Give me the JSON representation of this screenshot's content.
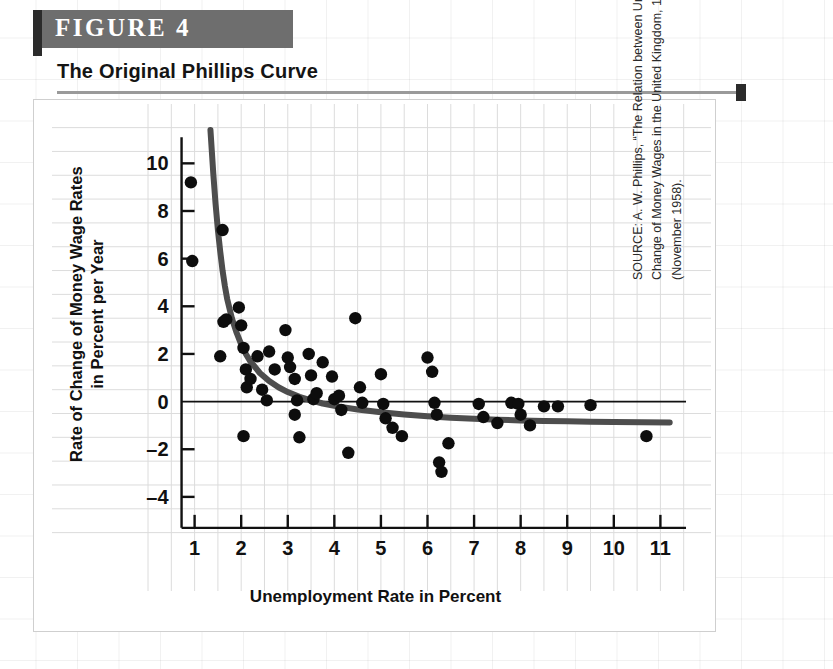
{
  "figure": {
    "banner_label": "FIGURE  4",
    "title": "The Original Phillips Curve",
    "banner_color": "#6e6e6e",
    "accent_color": "#2b2b2b"
  },
  "source": {
    "prefix": "SOURCE: A. W. Phillips, “The Relation between Unemployment and the Rate of Change of Money Wages in the United Kingdom, 1861–1957,” ",
    "journal": "Economica",
    "suffix": ", 25 (November 1958)."
  },
  "chart_data": {
    "type": "scatter",
    "title": "The Original Phillips Curve",
    "xlabel": "Unemployment Rate in Percent",
    "ylabel": "Rate of Change of Money Wage Rates\nin Percent per Year",
    "ylabel_line1": "Rate of Change of Money Wage Rates",
    "ylabel_line2": "in Percent per Year",
    "xlim": [
      0.3,
      11.7
    ],
    "ylim": [
      -5.6,
      11.4
    ],
    "xticks": [
      1,
      2,
      3,
      4,
      5,
      6,
      7,
      8,
      9,
      10,
      11
    ],
    "yticks": [
      10,
      8,
      6,
      4,
      2,
      0,
      -2,
      -4
    ],
    "grid": true,
    "grid_color": "#dcdcdc",
    "zero_line": 0,
    "point_color": "#0d0d0d",
    "point_radius": 6.2,
    "curve_color": "#4d4d4d",
    "curve_width": 6,
    "legend": "none",
    "series": [
      {
        "name": "Phillips scatter (UK 1861-1957)",
        "points": [
          [
            0.92,
            9.2
          ],
          [
            0.95,
            5.9
          ],
          [
            1.6,
            7.2
          ],
          [
            1.62,
            3.35
          ],
          [
            1.68,
            3.45
          ],
          [
            1.55,
            1.9
          ],
          [
            1.95,
            3.95
          ],
          [
            2.0,
            3.2
          ],
          [
            2.05,
            2.25
          ],
          [
            2.1,
            1.35
          ],
          [
            2.12,
            0.6
          ],
          [
            2.2,
            0.95
          ],
          [
            2.05,
            -1.45
          ],
          [
            2.35,
            1.9
          ],
          [
            2.45,
            0.5
          ],
          [
            2.6,
            2.1
          ],
          [
            2.72,
            1.35
          ],
          [
            2.55,
            0.05
          ],
          [
            2.95,
            3.0
          ],
          [
            3.0,
            1.85
          ],
          [
            3.05,
            1.45
          ],
          [
            3.15,
            0.95
          ],
          [
            3.2,
            0.05
          ],
          [
            3.15,
            -0.55
          ],
          [
            3.25,
            -1.5
          ],
          [
            3.45,
            2.0
          ],
          [
            3.5,
            1.1
          ],
          [
            3.55,
            0.1
          ],
          [
            3.62,
            0.35
          ],
          [
            3.75,
            1.65
          ],
          [
            3.95,
            1.05
          ],
          [
            4.0,
            0.1
          ],
          [
            4.1,
            0.25
          ],
          [
            4.15,
            -0.35
          ],
          [
            4.3,
            -2.15
          ],
          [
            4.45,
            3.5
          ],
          [
            4.55,
            0.6
          ],
          [
            4.6,
            -0.05
          ],
          [
            5.0,
            1.15
          ],
          [
            5.05,
            -0.1
          ],
          [
            5.1,
            -0.7
          ],
          [
            5.25,
            -1.1
          ],
          [
            5.45,
            -1.45
          ],
          [
            6.0,
            1.85
          ],
          [
            6.1,
            1.25
          ],
          [
            6.15,
            -0.05
          ],
          [
            6.2,
            -0.55
          ],
          [
            6.25,
            -2.55
          ],
          [
            6.3,
            -2.95
          ],
          [
            6.45,
            -1.75
          ],
          [
            7.1,
            -0.1
          ],
          [
            7.2,
            -0.65
          ],
          [
            7.5,
            -0.9
          ],
          [
            7.8,
            -0.05
          ],
          [
            7.95,
            -0.1
          ],
          [
            8.0,
            -0.55
          ],
          [
            8.2,
            -1.0
          ],
          [
            8.5,
            -0.2
          ],
          [
            8.8,
            -0.2
          ],
          [
            9.5,
            -0.15
          ],
          [
            10.7,
            -1.45
          ]
        ]
      }
    ],
    "fitted_curve": {
      "name": "Phillips fitted curve",
      "description": "Downward-sloping convex curve asymptotic to about -0.9",
      "asymptote": -0.9,
      "points": [
        [
          1.34,
          11.4
        ],
        [
          1.4,
          9.6
        ],
        [
          1.45,
          8.3
        ],
        [
          1.5,
          7.2
        ],
        [
          1.55,
          6.3
        ],
        [
          1.6,
          5.5
        ],
        [
          1.65,
          4.85
        ],
        [
          1.7,
          4.3
        ],
        [
          1.8,
          3.5
        ],
        [
          1.9,
          2.9
        ],
        [
          2.0,
          2.4
        ],
        [
          2.1,
          2.0
        ],
        [
          2.2,
          1.68
        ],
        [
          2.4,
          1.2
        ],
        [
          2.6,
          0.86
        ],
        [
          2.8,
          0.6
        ],
        [
          3.0,
          0.4
        ],
        [
          3.25,
          0.2
        ],
        [
          3.5,
          0.05
        ],
        [
          3.75,
          -0.08
        ],
        [
          4.0,
          -0.18
        ],
        [
          4.5,
          -0.33
        ],
        [
          5.0,
          -0.45
        ],
        [
          5.5,
          -0.54
        ],
        [
          6.0,
          -0.62
        ],
        [
          6.5,
          -0.68
        ],
        [
          7.0,
          -0.72
        ],
        [
          7.5,
          -0.76
        ],
        [
          8.0,
          -0.79
        ],
        [
          8.5,
          -0.81
        ],
        [
          9.0,
          -0.83
        ],
        [
          9.5,
          -0.85
        ],
        [
          10.0,
          -0.86
        ],
        [
          10.6,
          -0.87
        ],
        [
          11.2,
          -0.88
        ]
      ]
    }
  }
}
